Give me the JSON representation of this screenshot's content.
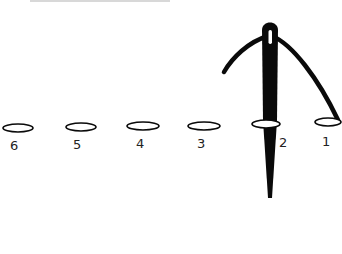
{
  "diagram": {
    "type": "illustration",
    "colors": {
      "ink": "#0a0a0a",
      "background": "#ffffff",
      "bead_fill": "#ffffff"
    },
    "beads": [
      {
        "label": "6",
        "cx": 18,
        "cy": 128,
        "rx": 15,
        "ry": 4,
        "label_x": 15,
        "label_y": 150
      },
      {
        "label": "5",
        "cx": 81,
        "cy": 127,
        "rx": 15,
        "ry": 4,
        "label_x": 77,
        "label_y": 149
      },
      {
        "label": "4",
        "cx": 143,
        "cy": 126,
        "rx": 16,
        "ry": 4,
        "label_x": 140,
        "label_y": 148
      },
      {
        "label": "3",
        "cx": 204,
        "cy": 126,
        "rx": 16,
        "ry": 4,
        "label_x": 201,
        "label_y": 148
      },
      {
        "label": "2",
        "cx": 266,
        "cy": 124,
        "rx": 14,
        "ry": 4,
        "label_x": 283,
        "label_y": 147
      },
      {
        "label": "1",
        "cx": 328,
        "cy": 122,
        "rx": 13,
        "ry": 4,
        "label_x": 325,
        "label_y": 146
      }
    ],
    "needle": {
      "eye_top_y": 18,
      "tip_y": 198,
      "center_x": 270
    },
    "thread": {
      "from": "bead 1",
      "through": "needle eye",
      "loose_end": "left"
    }
  }
}
